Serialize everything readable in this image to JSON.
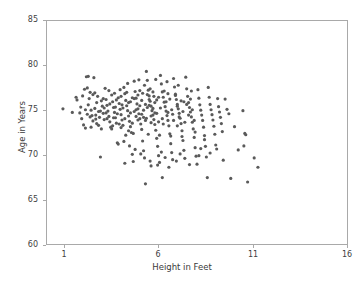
{
  "chart_data": {
    "type": "scatter",
    "title": "",
    "xlabel": "Height in Feet",
    "ylabel": "Age in Years",
    "xlim": [
      0.0,
      16.0
    ],
    "ylim": [
      60,
      85
    ],
    "xticks": [
      1,
      6,
      11,
      16
    ],
    "yticks": [
      60,
      65,
      70,
      75,
      80,
      85
    ],
    "xtick_labels": [
      "1",
      "6",
      "11",
      "16"
    ],
    "ytick_labels": [
      "60",
      "65",
      "70",
      "75",
      "80",
      "85"
    ],
    "grid": false,
    "legend": null,
    "marker": {
      "color": "#5a5a5a",
      "size": 1.6,
      "shape": "circle"
    },
    "n_points": 310,
    "series": [
      {
        "name": "observations",
        "points": [
          [
            0.85,
            75.15
          ],
          [
            1.35,
            74.75
          ],
          [
            1.55,
            76.45
          ],
          [
            1.6,
            76.15
          ],
          [
            1.75,
            74.7
          ],
          [
            1.8,
            75.35
          ],
          [
            1.85,
            74.05
          ],
          [
            1.95,
            73.35
          ],
          [
            2.0,
            77.35
          ],
          [
            2.05,
            75.05
          ],
          [
            2.1,
            78.75
          ],
          [
            2.15,
            74.55
          ],
          [
            2.2,
            78.8
          ],
          [
            2.25,
            76.3
          ],
          [
            2.3,
            74.25
          ],
          [
            2.35,
            75.0
          ],
          [
            2.4,
            74.4
          ],
          [
            2.45,
            73.8
          ],
          [
            2.5,
            78.65
          ],
          [
            2.55,
            75.2
          ],
          [
            2.6,
            74.0
          ],
          [
            2.65,
            73.5
          ],
          [
            2.7,
            76.55
          ],
          [
            2.75,
            74.85
          ],
          [
            2.8,
            74.2
          ],
          [
            2.85,
            69.75
          ],
          [
            2.9,
            76.05
          ],
          [
            2.95,
            75.45
          ],
          [
            3.0,
            74.65
          ],
          [
            3.05,
            73.95
          ],
          [
            3.1,
            77.45
          ],
          [
            3.15,
            76.2
          ],
          [
            3.2,
            75.55
          ],
          [
            3.25,
            74.9
          ],
          [
            3.3,
            74.3
          ],
          [
            3.35,
            73.7
          ],
          [
            3.4,
            73.1
          ],
          [
            3.45,
            76.7
          ],
          [
            3.5,
            75.95
          ],
          [
            3.55,
            75.3
          ],
          [
            3.6,
            74.75
          ],
          [
            3.65,
            74.15
          ],
          [
            3.7,
            73.55
          ],
          [
            3.75,
            71.35
          ],
          [
            3.8,
            76.4
          ],
          [
            3.85,
            75.75
          ],
          [
            3.9,
            75.1
          ],
          [
            3.95,
            74.5
          ],
          [
            4.0,
            73.9
          ],
          [
            4.05,
            73.3
          ],
          [
            4.1,
            77.55
          ],
          [
            4.15,
            76.85
          ],
          [
            4.2,
            76.1
          ],
          [
            4.25,
            75.5
          ],
          [
            4.3,
            74.95
          ],
          [
            4.35,
            74.35
          ],
          [
            4.4,
            73.75
          ],
          [
            4.45,
            73.15
          ],
          [
            4.5,
            72.5
          ],
          [
            4.55,
            70.05
          ],
          [
            4.6,
            69.25
          ],
          [
            4.65,
            78.25
          ],
          [
            4.7,
            77.1
          ],
          [
            4.75,
            76.35
          ],
          [
            4.8,
            75.7
          ],
          [
            4.85,
            75.15
          ],
          [
            4.9,
            74.6
          ],
          [
            4.95,
            74.05
          ],
          [
            5.0,
            73.45
          ],
          [
            5.05,
            72.85
          ],
          [
            5.1,
            71.55
          ],
          [
            5.15,
            70.45
          ],
          [
            5.2,
            69.65
          ],
          [
            5.25,
            66.75
          ],
          [
            5.3,
            79.35
          ],
          [
            5.35,
            78.35
          ],
          [
            5.4,
            77.25
          ],
          [
            5.45,
            76.6
          ],
          [
            5.5,
            76.0
          ],
          [
            5.55,
            75.45
          ],
          [
            5.6,
            74.95
          ],
          [
            5.65,
            74.45
          ],
          [
            5.7,
            73.95
          ],
          [
            5.75,
            73.4
          ],
          [
            5.8,
            72.75
          ],
          [
            5.85,
            71.85
          ],
          [
            5.9,
            70.95
          ],
          [
            5.95,
            69.9
          ],
          [
            6.0,
            69.15
          ],
          [
            6.05,
            78.9
          ],
          [
            6.1,
            77.95
          ],
          [
            6.15,
            77.05
          ],
          [
            6.2,
            76.45
          ],
          [
            6.25,
            75.9
          ],
          [
            6.3,
            75.4
          ],
          [
            6.35,
            74.9
          ],
          [
            6.4,
            74.4
          ],
          [
            6.45,
            73.85
          ],
          [
            6.5,
            73.25
          ],
          [
            6.55,
            72.35
          ],
          [
            6.6,
            71.25
          ],
          [
            6.65,
            70.25
          ],
          [
            6.7,
            69.45
          ],
          [
            6.75,
            78.55
          ],
          [
            6.8,
            77.6
          ],
          [
            6.85,
            76.8
          ],
          [
            6.9,
            76.2
          ],
          [
            6.95,
            75.65
          ],
          [
            7.0,
            75.15
          ],
          [
            7.05,
            74.65
          ],
          [
            7.1,
            74.1
          ],
          [
            7.15,
            73.5
          ],
          [
            7.2,
            72.7
          ],
          [
            7.25,
            71.6
          ],
          [
            7.3,
            70.5
          ],
          [
            7.35,
            69.6
          ],
          [
            7.4,
            78.7
          ],
          [
            7.45,
            77.4
          ],
          [
            7.5,
            76.55
          ],
          [
            7.55,
            75.85
          ],
          [
            7.6,
            75.3
          ],
          [
            7.65,
            74.8
          ],
          [
            7.7,
            74.25
          ],
          [
            7.75,
            73.65
          ],
          [
            7.8,
            72.9
          ],
          [
            7.85,
            71.95
          ],
          [
            7.9,
            70.8
          ],
          [
            7.95,
            69.85
          ],
          [
            8.0,
            68.95
          ],
          [
            8.05,
            77.3
          ],
          [
            8.1,
            76.35
          ],
          [
            8.15,
            75.6
          ],
          [
            8.2,
            75.0
          ],
          [
            8.25,
            74.45
          ],
          [
            8.3,
            73.85
          ],
          [
            8.35,
            73.1
          ],
          [
            8.4,
            72.15
          ],
          [
            8.45,
            70.95
          ],
          [
            8.5,
            69.75
          ],
          [
            8.55,
            67.45
          ],
          [
            8.6,
            77.55
          ],
          [
            8.65,
            76.45
          ],
          [
            8.7,
            75.65
          ],
          [
            8.75,
            75.05
          ],
          [
            8.8,
            74.5
          ],
          [
            8.85,
            73.9
          ],
          [
            8.9,
            73.2
          ],
          [
            8.95,
            72.3
          ],
          [
            9.0,
            71.1
          ],
          [
            9.05,
            70.65
          ],
          [
            9.1,
            76.3
          ],
          [
            9.15,
            75.4
          ],
          [
            9.2,
            74.8
          ],
          [
            9.25,
            74.2
          ],
          [
            9.3,
            73.5
          ],
          [
            9.35,
            72.6
          ],
          [
            9.4,
            69.4
          ],
          [
            9.5,
            76.25
          ],
          [
            9.6,
            75.1
          ],
          [
            9.7,
            74.6
          ],
          [
            9.8,
            67.35
          ],
          [
            10.0,
            73.15
          ],
          [
            10.2,
            70.55
          ],
          [
            10.45,
            74.95
          ],
          [
            10.5,
            71.0
          ],
          [
            10.55,
            72.4
          ],
          [
            10.6,
            72.25
          ],
          [
            10.7,
            66.95
          ],
          [
            11.05,
            69.65
          ],
          [
            11.25,
            68.6
          ],
          [
            2.2,
            75.6
          ],
          [
            2.45,
            76.75
          ],
          [
            2.6,
            74.45
          ],
          [
            2.85,
            74.9
          ],
          [
            3.05,
            75.25
          ],
          [
            3.2,
            74.05
          ],
          [
            3.35,
            75.7
          ],
          [
            3.5,
            73.25
          ],
          [
            3.6,
            76.9
          ],
          [
            3.75,
            74.6
          ],
          [
            3.85,
            73.45
          ],
          [
            3.95,
            76.55
          ],
          [
            4.05,
            75.25
          ],
          [
            4.15,
            74.05
          ],
          [
            4.25,
            77.0
          ],
          [
            4.35,
            75.85
          ],
          [
            4.45,
            74.7
          ],
          [
            4.55,
            73.55
          ],
          [
            4.65,
            76.3
          ],
          [
            4.75,
            75.05
          ],
          [
            4.85,
            73.9
          ],
          [
            4.95,
            77.2
          ],
          [
            5.05,
            76.1
          ],
          [
            5.15,
            75.0
          ],
          [
            5.25,
            73.85
          ],
          [
            5.35,
            76.75
          ],
          [
            5.45,
            75.55
          ],
          [
            5.55,
            74.35
          ],
          [
            5.65,
            77.05
          ],
          [
            5.75,
            75.85
          ],
          [
            5.85,
            74.65
          ],
          [
            5.95,
            76.45
          ],
          [
            6.05,
            75.25
          ],
          [
            6.15,
            74.05
          ],
          [
            6.25,
            77.15
          ],
          [
            6.35,
            75.95
          ],
          [
            6.45,
            74.75
          ],
          [
            6.55,
            76.25
          ],
          [
            6.65,
            75.05
          ],
          [
            6.75,
            73.85
          ],
          [
            6.85,
            76.65
          ],
          [
            6.95,
            75.45
          ],
          [
            7.05,
            74.25
          ],
          [
            7.15,
            76.05
          ],
          [
            7.25,
            74.85
          ],
          [
            7.35,
            73.65
          ],
          [
            7.45,
            75.65
          ],
          [
            7.55,
            74.45
          ],
          [
            7.65,
            76.25
          ],
          [
            7.75,
            75.05
          ],
          [
            7.85,
            73.85
          ],
          [
            3.15,
            74.7
          ],
          [
            3.45,
            72.9
          ],
          [
            3.65,
            75.35
          ],
          [
            4.2,
            72.2
          ],
          [
            4.4,
            71.0
          ],
          [
            4.7,
            70.6
          ],
          [
            5.0,
            70.1
          ],
          [
            5.5,
            69.3
          ],
          [
            6.1,
            70.3
          ],
          [
            6.3,
            69.7
          ],
          [
            6.9,
            69.3
          ],
          [
            7.1,
            70.1
          ],
          [
            7.6,
            68.9
          ],
          [
            8.1,
            69.9
          ],
          [
            2.05,
            73.0
          ],
          [
            2.3,
            77.0
          ],
          [
            2.75,
            73.3
          ],
          [
            3.3,
            77.2
          ],
          [
            3.9,
            77.3
          ],
          [
            4.3,
            78.0
          ],
          [
            4.9,
            78.4
          ],
          [
            5.2,
            77.8
          ],
          [
            5.8,
            78.45
          ],
          [
            6.4,
            78.2
          ],
          [
            7.0,
            77.8
          ],
          [
            7.7,
            77.15
          ],
          [
            2.9,
            72.9
          ],
          [
            3.8,
            71.2
          ],
          [
            4.1,
            71.5
          ],
          [
            4.6,
            72.4
          ],
          [
            5.4,
            72.3
          ],
          [
            6.0,
            72.2
          ],
          [
            6.6,
            72.1
          ],
          [
            7.2,
            72.05
          ],
          [
            7.9,
            72.55
          ],
          [
            8.4,
            71.7
          ],
          [
            1.9,
            76.6
          ],
          [
            2.15,
            77.5
          ],
          [
            2.55,
            76.95
          ],
          [
            5.05,
            74.55
          ],
          [
            5.15,
            74.2
          ],
          [
            5.25,
            75.65
          ],
          [
            5.35,
            75.3
          ],
          [
            5.45,
            76.2
          ],
          [
            5.55,
            73.6
          ],
          [
            5.65,
            75.2
          ],
          [
            5.75,
            74.7
          ],
          [
            5.85,
            76.15
          ],
          [
            5.95,
            73.7
          ],
          [
            4.45,
            75.95
          ],
          [
            4.55,
            76.4
          ],
          [
            4.65,
            74.85
          ],
          [
            4.75,
            74.3
          ],
          [
            4.85,
            76.7
          ],
          [
            4.95,
            75.5
          ],
          [
            5.1,
            76.9
          ],
          [
            5.3,
            74.1
          ],
          [
            5.5,
            77.4
          ],
          [
            5.7,
            76.55
          ],
          [
            6.2,
            73.45
          ],
          [
            6.45,
            76.85
          ],
          [
            6.7,
            74.55
          ],
          [
            6.95,
            73.25
          ],
          [
            7.3,
            75.95
          ],
          [
            3.55,
            74.15
          ],
          [
            3.95,
            73.05
          ],
          [
            4.35,
            72.7
          ],
          [
            8.2,
            70.7
          ],
          [
            8.7,
            70.2
          ],
          [
            6.15,
            67.45
          ],
          [
            5.55,
            68.75
          ],
          [
            5.9,
            68.85
          ],
          [
            6.5,
            68.6
          ],
          [
            4.15,
            69.05
          ],
          [
            2.35,
            73.1
          ],
          [
            2.65,
            75.85
          ],
          [
            3.0,
            76.3
          ],
          [
            3.7,
            76.15
          ],
          [
            4.0,
            75.6
          ]
        ]
      }
    ]
  },
  "axes": {
    "xlabel": "Height in Feet",
    "ylabel": "Age in Years"
  }
}
